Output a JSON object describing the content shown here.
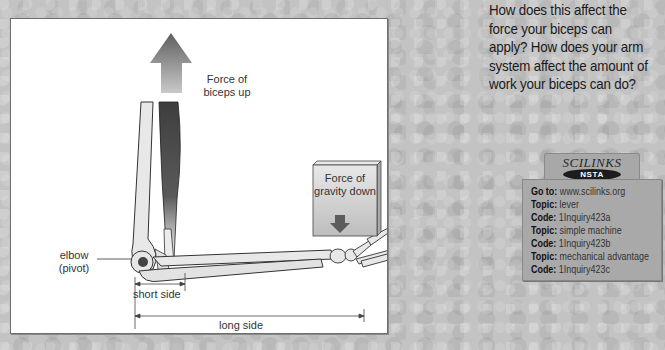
{
  "question": {
    "text": "How does this affect the force your biceps can apply? How does your arm system affect the amount of work your biceps can do?"
  },
  "diagram": {
    "labels": {
      "biceps_force": [
        "Force of",
        "biceps up"
      ],
      "gravity_force": [
        "Force of",
        "gravity down"
      ],
      "elbow": [
        "elbow",
        "(pivot)"
      ],
      "short_side": "short side",
      "long_side": "long side"
    },
    "colors": {
      "panel_bg": "#ffffff",
      "bone_fill": "#e6e6e6",
      "muscle_dark": "#4a4a4a",
      "arrow_dark": "#6a6a6a",
      "box_fill": "#cfcfcf"
    }
  },
  "scilinks": {
    "logo": "SCILINKS",
    "badge": "NSTA",
    "entries": [
      {
        "key": "Go to:",
        "value": "www.scilinks.org"
      },
      {
        "key": "Topic:",
        "value": "lever"
      },
      {
        "key": "Code:",
        "value": "1Inquiry423a"
      },
      {
        "key": "Topic:",
        "value": "simple machine"
      },
      {
        "key": "Code:",
        "value": "1Inquiry423b"
      },
      {
        "key": "Topic:",
        "value": "mechanical advantage"
      },
      {
        "key": "Code:",
        "value": "1Inquiry423c"
      }
    ]
  }
}
